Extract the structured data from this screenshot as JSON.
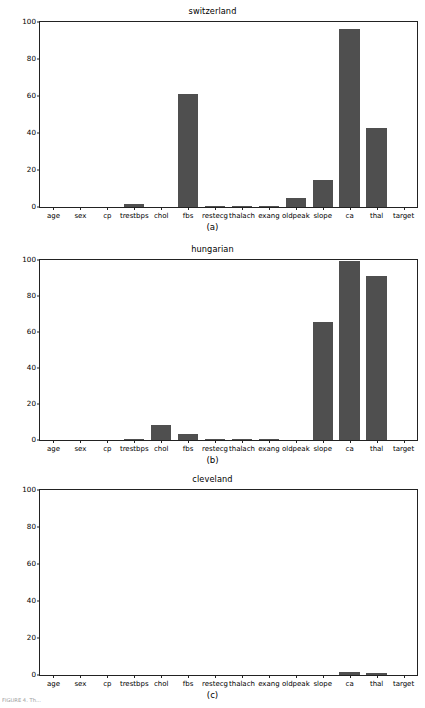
{
  "figure": {
    "width": 425,
    "height": 708,
    "background": "#ffffff",
    "bar_color": "#4f4f4f",
    "axis_color": "#222222",
    "footer_text": "FIGURE 4. Th..."
  },
  "chart_data": [
    {
      "type": "bar",
      "title": "switzerland",
      "panel": "(a)",
      "xlabel": "",
      "ylabel": "",
      "ylim": [
        0,
        100
      ],
      "yticks": [
        0,
        20,
        40,
        60,
        80,
        100
      ],
      "grid": false,
      "legend": null,
      "categories": [
        "age",
        "sex",
        "cp",
        "trestbps",
        "chol",
        "fbs",
        "restecg",
        "thalach",
        "exang",
        "oldpeak",
        "slope",
        "ca",
        "thal",
        "target"
      ],
      "values": [
        0,
        0,
        0,
        1.6,
        0,
        61.2,
        0.8,
        0.8,
        0.8,
        5.1,
        14.4,
        96.3,
        42.6,
        0
      ]
    },
    {
      "type": "bar",
      "title": "hungarian",
      "panel": "(b)",
      "xlabel": "",
      "ylabel": "",
      "ylim": [
        0,
        100
      ],
      "yticks": [
        0,
        20,
        40,
        60,
        80,
        100
      ],
      "grid": false,
      "legend": null,
      "categories": [
        "age",
        "sex",
        "cp",
        "trestbps",
        "chol",
        "fbs",
        "restecg",
        "thalach",
        "exang",
        "oldpeak",
        "slope",
        "ca",
        "thal",
        "target"
      ],
      "values": [
        0,
        0,
        0,
        0.3,
        8.2,
        3.1,
        0.3,
        0.3,
        0.3,
        0,
        65.3,
        99.5,
        90.9,
        0
      ]
    },
    {
      "type": "bar",
      "title": "cleveland",
      "panel": "(c)",
      "xlabel": "",
      "ylabel": "",
      "ylim": [
        0,
        100
      ],
      "yticks": [
        0,
        20,
        40,
        60,
        80,
        100
      ],
      "grid": false,
      "legend": null,
      "categories": [
        "age",
        "sex",
        "cp",
        "trestbps",
        "chol",
        "fbs",
        "restecg",
        "thalach",
        "exang",
        "oldpeak",
        "slope",
        "ca",
        "thal",
        "target"
      ],
      "values": [
        0,
        0,
        0,
        0,
        0,
        0,
        0,
        0,
        0,
        0,
        0,
        1.9,
        0.9,
        0
      ]
    }
  ]
}
